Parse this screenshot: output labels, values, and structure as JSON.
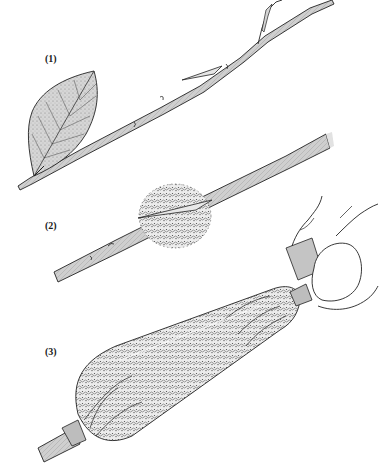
{
  "illustration": {
    "subject": "Air layering steps",
    "colors": {
      "ink": "#1f1f1f",
      "bark": "#c8c8c8",
      "leaf": "#d2d2d2",
      "moss": "#bdbdbd",
      "tape": "#b9b9b9",
      "background": "#ffffff"
    },
    "steps": [
      {
        "label": "(1)",
        "depicts": "Branch with leaf and cut made in stem"
      },
      {
        "label": "(2)",
        "depicts": "Sphagnum moss wrapped around the cut"
      },
      {
        "label": "(3)",
        "depicts": "Moss enclosed in plastic film, tied with tape at both ends"
      }
    ]
  }
}
